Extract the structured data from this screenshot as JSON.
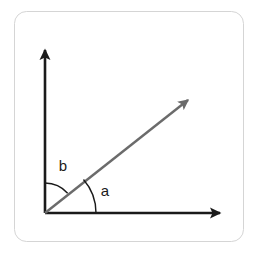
{
  "figure": {
    "background_color": "#ffffff",
    "card": {
      "fill": "#ffffff",
      "border_color": "#d5d5d5",
      "border_radius": 12,
      "x": 14,
      "y": 11,
      "width": 230,
      "height": 231
    },
    "origin": {
      "x": 45,
      "y": 213
    },
    "axes": {
      "color": "#1a1a1a",
      "stroke_width": 2.6,
      "y_axis": {
        "name": "vertical-axis",
        "from": {
          "x": 45,
          "y": 213
        },
        "to": {
          "x": 45,
          "y": 42
        },
        "arrowhead": true
      },
      "x_axis": {
        "name": "horizontal-axis",
        "from": {
          "x": 45,
          "y": 213
        },
        "to": {
          "x": 228,
          "y": 213
        },
        "arrowhead": true
      }
    },
    "ray": {
      "name": "diagonal-ray",
      "color": "#6b6b6b",
      "stroke_width": 2.4,
      "from": {
        "x": 45,
        "y": 213
      },
      "to": {
        "x": 196,
        "y": 93
      },
      "angle_degrees": 41,
      "arrowhead": true
    },
    "arcs": [
      {
        "id": "arc-b",
        "label": "b",
        "color": "#1a1a1a",
        "stroke_width": 1.4,
        "radius": 30,
        "start_angle_degrees": 41,
        "end_angle_degrees": 90,
        "between": "diagonal-ray and vertical-axis"
      },
      {
        "id": "arc-a",
        "label": "a",
        "color": "#1a1a1a",
        "stroke_width": 1.4,
        "radius": 51,
        "start_angle_degrees": 0,
        "end_angle_degrees": 41,
        "between": "horizontal-axis and diagonal-ray"
      }
    ],
    "labels": [
      {
        "id": "label-a",
        "text": "a",
        "x": 105,
        "y": 192
      },
      {
        "id": "label-b",
        "text": "b",
        "x": 63,
        "y": 167
      }
    ]
  }
}
